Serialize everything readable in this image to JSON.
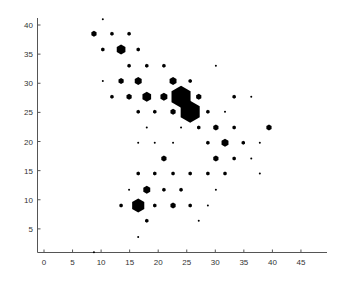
{
  "chart_data": {
    "type": "scatter",
    "subtype": "hexbin",
    "title": "",
    "xlabel": "",
    "ylabel": "",
    "xlim": [
      -1,
      50
    ],
    "ylim": [
      0,
      41
    ],
    "xticks": [
      0,
      5,
      10,
      15,
      20,
      25,
      30,
      35,
      40,
      45
    ],
    "yticks": [
      5,
      10,
      15,
      20,
      25,
      30,
      35,
      40
    ],
    "grid": false,
    "legend": null,
    "marker": "hexagon",
    "marker_color": "#000000",
    "points": [
      {
        "x": 10.3,
        "y": 41.0,
        "size": 1
      },
      {
        "x": 8.75,
        "y": 38.5,
        "size": 3
      },
      {
        "x": 11.9,
        "y": 38.5,
        "size": 2
      },
      {
        "x": 14.9,
        "y": 38.5,
        "size": 2
      },
      {
        "x": 10.3,
        "y": 35.8,
        "size": 2
      },
      {
        "x": 13.5,
        "y": 35.8,
        "size": 5
      },
      {
        "x": 16.5,
        "y": 35.8,
        "size": 2
      },
      {
        "x": 14.9,
        "y": 33.0,
        "size": 2
      },
      {
        "x": 18.0,
        "y": 33.0,
        "size": 2
      },
      {
        "x": 21.0,
        "y": 33.0,
        "size": 2
      },
      {
        "x": 30.1,
        "y": 33.0,
        "size": 1
      },
      {
        "x": 10.3,
        "y": 30.4,
        "size": 1
      },
      {
        "x": 13.5,
        "y": 30.4,
        "size": 3
      },
      {
        "x": 16.5,
        "y": 30.4,
        "size": 4
      },
      {
        "x": 22.6,
        "y": 30.4,
        "size": 4
      },
      {
        "x": 25.6,
        "y": 30.4,
        "size": 2
      },
      {
        "x": 11.9,
        "y": 27.7,
        "size": 2
      },
      {
        "x": 14.9,
        "y": 27.7,
        "size": 3
      },
      {
        "x": 18.0,
        "y": 27.7,
        "size": 5
      },
      {
        "x": 21.0,
        "y": 27.7,
        "size": 4
      },
      {
        "x": 24.0,
        "y": 27.7,
        "size": 11
      },
      {
        "x": 27.1,
        "y": 27.7,
        "size": 3
      },
      {
        "x": 33.3,
        "y": 27.7,
        "size": 2
      },
      {
        "x": 36.3,
        "y": 27.7,
        "size": 1
      },
      {
        "x": 16.5,
        "y": 25.1,
        "size": 2
      },
      {
        "x": 19.4,
        "y": 25.1,
        "size": 2
      },
      {
        "x": 22.6,
        "y": 25.1,
        "size": 3
      },
      {
        "x": 25.6,
        "y": 25.1,
        "size": 11
      },
      {
        "x": 28.7,
        "y": 25.1,
        "size": 2
      },
      {
        "x": 31.7,
        "y": 25.1,
        "size": 1
      },
      {
        "x": 18.0,
        "y": 22.4,
        "size": 1
      },
      {
        "x": 24.0,
        "y": 22.4,
        "size": 1
      },
      {
        "x": 27.1,
        "y": 22.4,
        "size": 2
      },
      {
        "x": 30.1,
        "y": 22.4,
        "size": 3
      },
      {
        "x": 33.3,
        "y": 22.4,
        "size": 2
      },
      {
        "x": 39.4,
        "y": 22.4,
        "size": 3
      },
      {
        "x": 16.5,
        "y": 19.8,
        "size": 1
      },
      {
        "x": 19.4,
        "y": 19.8,
        "size": 1
      },
      {
        "x": 22.6,
        "y": 19.8,
        "size": 1
      },
      {
        "x": 28.7,
        "y": 19.8,
        "size": 2
      },
      {
        "x": 31.7,
        "y": 19.8,
        "size": 4
      },
      {
        "x": 34.9,
        "y": 19.8,
        "size": 2
      },
      {
        "x": 37.8,
        "y": 19.8,
        "size": 1
      },
      {
        "x": 21.0,
        "y": 17.1,
        "size": 3
      },
      {
        "x": 30.1,
        "y": 17.1,
        "size": 3
      },
      {
        "x": 33.3,
        "y": 17.1,
        "size": 2
      },
      {
        "x": 36.3,
        "y": 17.1,
        "size": 1
      },
      {
        "x": 16.5,
        "y": 14.5,
        "size": 2
      },
      {
        "x": 19.4,
        "y": 14.5,
        "size": 2
      },
      {
        "x": 22.6,
        "y": 14.5,
        "size": 2
      },
      {
        "x": 25.6,
        "y": 14.5,
        "size": 2
      },
      {
        "x": 28.7,
        "y": 14.5,
        "size": 2
      },
      {
        "x": 31.7,
        "y": 14.5,
        "size": 2
      },
      {
        "x": 37.8,
        "y": 14.5,
        "size": 1
      },
      {
        "x": 14.9,
        "y": 11.7,
        "size": 1
      },
      {
        "x": 18.0,
        "y": 11.7,
        "size": 4
      },
      {
        "x": 21.0,
        "y": 11.7,
        "size": 2
      },
      {
        "x": 24.0,
        "y": 11.7,
        "size": 2
      },
      {
        "x": 30.1,
        "y": 11.7,
        "size": 1
      },
      {
        "x": 13.5,
        "y": 9.0,
        "size": 2
      },
      {
        "x": 16.5,
        "y": 9.0,
        "size": 7
      },
      {
        "x": 19.4,
        "y": 9.0,
        "size": 2
      },
      {
        "x": 22.6,
        "y": 9.0,
        "size": 3
      },
      {
        "x": 25.6,
        "y": 9.0,
        "size": 2
      },
      {
        "x": 28.7,
        "y": 9.0,
        "size": 1
      },
      {
        "x": 18.0,
        "y": 6.4,
        "size": 2
      },
      {
        "x": 27.1,
        "y": 6.4,
        "size": 1
      },
      {
        "x": 16.5,
        "y": 3.6,
        "size": 1
      },
      {
        "x": 8.75,
        "y": 1.0,
        "size": 1
      }
    ]
  }
}
